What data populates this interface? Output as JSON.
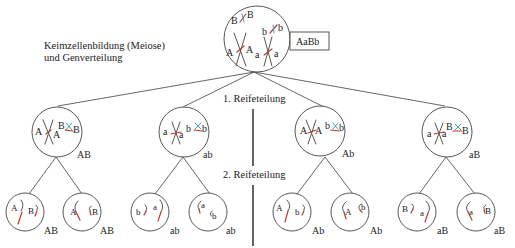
{
  "title": {
    "line1": "Keimzellenbildung (Meiose)",
    "line2": "und Genverteilung"
  },
  "parent": {
    "genotype_box": "AaBb",
    "alleles": {
      "B1": "B",
      "B2": "B",
      "b1": "b",
      "b2": "b",
      "A1": "A",
      "A2": "A",
      "a1": "a",
      "a2": "a"
    }
  },
  "stages": {
    "first": "1. Reifeteilung",
    "second": "2. Reifeteilung"
  },
  "meiosis1": [
    {
      "genotype": "AB",
      "left": [
        "A",
        "A"
      ],
      "right": [
        "B",
        "B"
      ]
    },
    {
      "genotype": "ab",
      "left": [
        "a",
        "a"
      ],
      "right": [
        "b",
        "b"
      ]
    },
    {
      "genotype": "Ab",
      "left": [
        "A",
        "A"
      ],
      "right": [
        "b",
        "b"
      ]
    },
    {
      "genotype": "aB",
      "left": [
        "a",
        "a"
      ],
      "right": [
        "B",
        "B"
      ]
    }
  ],
  "gametes": [
    {
      "genotype": "AB",
      "alleles": [
        "A",
        "B"
      ]
    },
    {
      "genotype": "AB",
      "alleles": [
        "A",
        "B"
      ]
    },
    {
      "genotype": "ab",
      "alleles": [
        "b",
        "a"
      ]
    },
    {
      "genotype": "ab",
      "alleles": [
        "a",
        "b"
      ]
    },
    {
      "genotype": "Ab",
      "alleles": [
        "A",
        "b"
      ]
    },
    {
      "genotype": "Ab",
      "alleles": [
        "A",
        "b"
      ]
    },
    {
      "genotype": "aB",
      "alleles": [
        "B",
        "a"
      ]
    },
    {
      "genotype": "aB",
      "alleles": [
        "a",
        "B"
      ]
    }
  ],
  "colors": {
    "chromosome_red": "#c0392b",
    "chromosome_cyan": "#3aa7b8",
    "outline": "#444444"
  }
}
